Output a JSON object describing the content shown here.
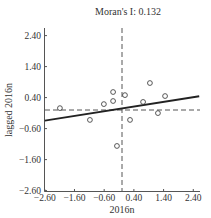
{
  "chart_data": {
    "type": "scatter",
    "title": "Moran's  I: 0.132",
    "xlabel": "2016n",
    "ylabel": "lagged 2016n",
    "xlim": [
      -2.6,
      2.6
    ],
    "ylim": [
      -2.6,
      2.6
    ],
    "x_ticks": [
      "-2.60",
      "-1.60",
      "-0.60",
      "0.40",
      "1.40",
      "2.40"
    ],
    "y_ticks": [
      "2.40",
      "1.40",
      "0.40",
      "-0.60",
      "-1.60",
      "-2.60"
    ],
    "grid": false,
    "legend": null,
    "points": [
      {
        "x": -2.09,
        "y": 0.06
      },
      {
        "x": -1.08,
        "y": -0.32
      },
      {
        "x": -0.61,
        "y": 0.19
      },
      {
        "x": -0.3,
        "y": 0.58
      },
      {
        "x": -0.3,
        "y": 0.29
      },
      {
        "x": -0.17,
        "y": -1.16
      },
      {
        "x": 0.1,
        "y": 0.48
      },
      {
        "x": 0.27,
        "y": -0.32
      },
      {
        "x": 0.71,
        "y": 0.26
      },
      {
        "x": 0.94,
        "y": 0.87
      },
      {
        "x": 1.21,
        "y": -0.1
      },
      {
        "x": 1.45,
        "y": 0.45
      }
    ],
    "regression_line": {
      "slope": 0.132,
      "intercept": 0.1
    },
    "reference_lines": {
      "vertical_x": 0.0,
      "horizontal_y": 0.0
    }
  }
}
